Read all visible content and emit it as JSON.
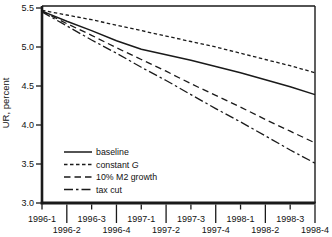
{
  "chart_data": {
    "type": "line",
    "title": "",
    "ylabel": "UR, percent",
    "xlabel": "",
    "ylim": [
      3.0,
      5.5
    ],
    "yticks": [
      3.0,
      3.5,
      4.0,
      4.5,
      5.0,
      5.5
    ],
    "grid": false,
    "legend_position": "lower-left",
    "categories": [
      "1996-1",
      "1996-2",
      "1996-3",
      "1996-4",
      "1997-1",
      "1997-2",
      "1997-3",
      "1997-4",
      "1998-1",
      "1998-2",
      "1998-3",
      "1998-4"
    ],
    "series": [
      {
        "name": "baseline",
        "style": "solid",
        "values": [
          5.46,
          5.33,
          5.21,
          5.08,
          4.97,
          4.9,
          4.83,
          4.75,
          4.67,
          4.58,
          4.49,
          4.39
        ]
      },
      {
        "name": "constant G",
        "style": "short-dash",
        "name_italic_part": "G",
        "values": [
          5.47,
          5.41,
          5.35,
          5.28,
          5.21,
          5.14,
          5.07,
          5.0,
          4.92,
          4.84,
          4.76,
          4.67
        ]
      },
      {
        "name": "10% M2 growth",
        "style": "dash",
        "values": [
          5.46,
          5.3,
          5.15,
          4.99,
          4.84,
          4.69,
          4.53,
          4.38,
          4.23,
          4.07,
          3.92,
          3.77
        ]
      },
      {
        "name": "tax cut",
        "style": "dash-dot",
        "values": [
          5.45,
          5.27,
          5.09,
          4.92,
          4.74,
          4.57,
          4.39,
          4.21,
          4.04,
          3.86,
          3.68,
          3.51
        ]
      }
    ],
    "colors": {
      "line": "#1a1a1a",
      "text": "#111111",
      "background": "#ffffff"
    }
  }
}
